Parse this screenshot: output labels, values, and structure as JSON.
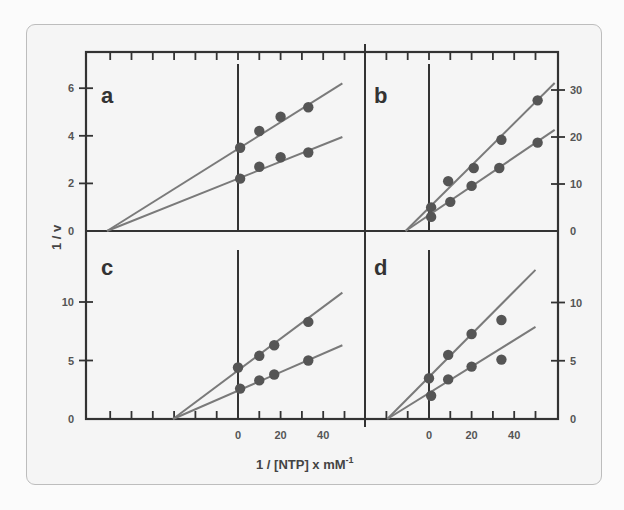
{
  "chart_data": [
    {
      "panel": "a",
      "type": "scatter",
      "xlabel": "1 / [NTP] x mM⁻¹",
      "ylabel": "1 / v",
      "xlim": [
        -70,
        55
      ],
      "ylim": [
        0,
        7.5
      ],
      "xticks": [
        0,
        20,
        40
      ],
      "yticks": [
        0,
        2,
        4,
        6
      ],
      "series": [
        {
          "name": "upper",
          "x": [
            1,
            10,
            20,
            33
          ],
          "y": [
            3.5,
            4.2,
            4.8,
            5.2
          ],
          "fit": {
            "x": [
              -61.5,
              49
            ],
            "y": [
              0,
              6.2
            ]
          }
        },
        {
          "name": "lower",
          "x": [
            1,
            10,
            20,
            33
          ],
          "y": [
            2.2,
            2.7,
            3.1,
            3.3
          ],
          "fit": {
            "x": [
              -61.5,
              49
            ],
            "y": [
              0,
              3.95
            ]
          }
        }
      ]
    },
    {
      "panel": "b",
      "type": "scatter",
      "xlim": [
        -30,
        60
      ],
      "ylim": [
        0,
        35
      ],
      "xticks": [],
      "yticks": [
        0,
        10,
        20,
        30
      ],
      "series": [
        {
          "name": "upper",
          "x": [
            1,
            9,
            21,
            34,
            51
          ],
          "y": [
            5,
            10.6,
            13.4,
            19.4,
            27.8
          ],
          "fit": {
            "x": [
              -11,
              59
            ],
            "y": [
              0,
              31.5
            ]
          }
        },
        {
          "name": "lower",
          "x": [
            1,
            10,
            20,
            33,
            51
          ],
          "y": [
            3,
            6.2,
            9.6,
            13.4,
            18.8
          ],
          "fit": {
            "x": [
              -11,
              59
            ],
            "y": [
              0,
              21.5
            ]
          }
        }
      ]
    },
    {
      "panel": "c",
      "type": "scatter",
      "xlim": [
        -70,
        55
      ],
      "ylim": [
        0,
        15
      ],
      "xticks": [
        0,
        20,
        40
      ],
      "yticks": [
        0,
        5,
        10
      ],
      "series": [
        {
          "name": "upper",
          "x": [
            0,
            10,
            17,
            33
          ],
          "y": [
            4.4,
            5.4,
            6.3,
            8.3
          ],
          "fit": {
            "x": [
              -30.5,
              49
            ],
            "y": [
              0,
              10.8
            ]
          }
        },
        {
          "name": "lower",
          "x": [
            1,
            10,
            17,
            33
          ],
          "y": [
            2.6,
            3.3,
            3.8,
            5.0
          ],
          "fit": {
            "x": [
              -30.5,
              49
            ],
            "y": [
              0,
              6.3
            ]
          }
        }
      ]
    },
    {
      "panel": "d",
      "type": "scatter",
      "xlim": [
        -30,
        60
      ],
      "ylim": [
        0,
        15
      ],
      "xticks": [
        0,
        20,
        40
      ],
      "yticks": [
        0,
        5,
        10
      ],
      "series": [
        {
          "name": "upper",
          "x": [
            0,
            9,
            20,
            34
          ],
          "y": [
            3.5,
            5.5,
            7.3,
            8.5
          ],
          "fit": {
            "x": [
              -19.6,
              50
            ],
            "y": [
              0,
              12.8
            ]
          }
        },
        {
          "name": "lower",
          "x": [
            1,
            9,
            20,
            34
          ],
          "y": [
            2.0,
            3.4,
            4.5,
            5.1
          ],
          "fit": {
            "x": [
              -19.6,
              50
            ],
            "y": [
              0,
              7.9
            ]
          }
        }
      ]
    }
  ],
  "labels": {
    "x_axis_title": "1 / [NTP]  x  mM",
    "x_axis_superscript": "-1",
    "y_axis_title": "1 / v",
    "panel_a": "a",
    "panel_b": "b",
    "panel_c": "c",
    "panel_d": "d"
  },
  "colors": {
    "frame": "#333333",
    "fit_line": "#7a7a7a",
    "marker": "#555555",
    "card_bg": "#f5f5f5"
  }
}
